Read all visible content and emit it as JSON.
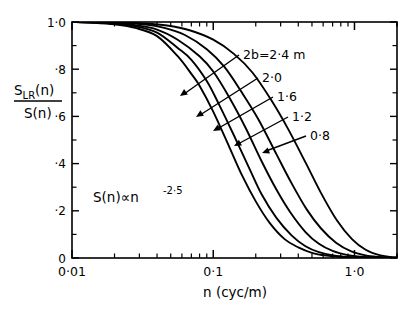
{
  "figure": {
    "name": "lateral-coherence-transfer-function",
    "background": "#ffffff",
    "ink": "#000000"
  },
  "axes": {
    "y": {
      "label_numerator": "S",
      "label_numerator_sub": "LR",
      "label_numerator_arg": "(n)",
      "label_denominator": "S(n)",
      "ticks": [
        "1·0",
        "·8",
        "·6",
        "·4",
        "·2",
        "0"
      ],
      "tick_values": [
        1.0,
        0.8,
        0.6,
        0.4,
        0.2,
        0.0
      ],
      "minor_ticks_per_major": 1,
      "range": [
        0,
        1
      ]
    },
    "x": {
      "label": "n (cyc/m)",
      "ticks": [
        "0·01",
        "0·1",
        "1·0"
      ],
      "tick_values": [
        0.01,
        0.1,
        1.0
      ],
      "scale": "log",
      "range": [
        0.01,
        2.0
      ]
    }
  },
  "annotations": {
    "spectrum_law": "S(n)∝n",
    "spectrum_exponent": "-2·5",
    "series_prefix": "2b=",
    "series_unit": " m"
  },
  "chart_data": {
    "type": "line",
    "title": "",
    "subtitle": "",
    "xlabel": "n (cyc/m)",
    "ylabel": "S_LR(n)/S(n)",
    "xscale": "log",
    "yscale": "linear",
    "xlim": [
      0.01,
      2.0
    ],
    "ylim": [
      0.0,
      1.0
    ],
    "grid": false,
    "legend_position": "inline-leader-labels",
    "xticks": [
      0.01,
      0.1,
      1.0
    ],
    "xticklabels": [
      "0·01",
      "0·1",
      "1·0"
    ],
    "yticks": [
      0.0,
      0.2,
      0.4,
      0.6,
      0.8,
      1.0
    ],
    "yticklabels": [
      "0",
      "·2",
      "·4",
      "·6",
      "·8",
      "1·0"
    ],
    "annotation_text": "S(n) ∝ n^(-2·5)",
    "series": [
      {
        "name": "2b=2·4 m",
        "label": "2b=2·4 m",
        "separation_2b_m": 2.4,
        "x": [
          0.01,
          0.014,
          0.02,
          0.028,
          0.04,
          0.056,
          0.07,
          0.08,
          0.1,
          0.13,
          0.16,
          0.2,
          0.25,
          0.32,
          0.4,
          0.5,
          0.63,
          0.8,
          1.0,
          1.3,
          1.6,
          2.0
        ],
        "y": [
          1.0,
          0.997,
          0.99,
          0.975,
          0.94,
          0.855,
          0.78,
          0.73,
          0.62,
          0.47,
          0.35,
          0.24,
          0.15,
          0.08,
          0.045,
          0.022,
          0.01,
          0.004,
          0.0015,
          0.0005,
          0.0002,
          0.0
        ]
      },
      {
        "name": "2·0",
        "label": "2·0",
        "separation_2b_m": 2.0,
        "x": [
          0.01,
          0.014,
          0.02,
          0.028,
          0.04,
          0.056,
          0.07,
          0.09,
          0.11,
          0.14,
          0.18,
          0.22,
          0.28,
          0.36,
          0.45,
          0.56,
          0.71,
          0.9,
          1.12,
          1.4,
          1.8,
          2.0
        ],
        "y": [
          1.0,
          0.998,
          0.993,
          0.982,
          0.955,
          0.89,
          0.84,
          0.75,
          0.65,
          0.52,
          0.38,
          0.27,
          0.17,
          0.095,
          0.05,
          0.025,
          0.011,
          0.004,
          0.0015,
          0.0005,
          0.0001,
          0.0
        ]
      },
      {
        "name": "1·6",
        "label": "1·6",
        "separation_2b_m": 1.6,
        "x": [
          0.01,
          0.014,
          0.02,
          0.028,
          0.04,
          0.056,
          0.08,
          0.1,
          0.13,
          0.17,
          0.22,
          0.28,
          0.35,
          0.45,
          0.56,
          0.7,
          0.9,
          1.12,
          1.4,
          1.8,
          2.0
        ],
        "y": [
          1.0,
          0.999,
          0.995,
          0.987,
          0.968,
          0.925,
          0.855,
          0.79,
          0.68,
          0.55,
          0.41,
          0.29,
          0.195,
          0.11,
          0.06,
          0.03,
          0.012,
          0.005,
          0.002,
          0.0004,
          0.0
        ]
      },
      {
        "name": "1·2",
        "label": "1·2",
        "separation_2b_m": 1.2,
        "x": [
          0.01,
          0.015,
          0.022,
          0.032,
          0.045,
          0.063,
          0.09,
          0.12,
          0.16,
          0.21,
          0.28,
          0.36,
          0.46,
          0.58,
          0.74,
          0.95,
          1.2,
          1.5,
          1.8,
          2.0
        ],
        "y": [
          1.0,
          0.999,
          0.996,
          0.99,
          0.975,
          0.945,
          0.885,
          0.81,
          0.7,
          0.585,
          0.44,
          0.315,
          0.205,
          0.125,
          0.065,
          0.028,
          0.011,
          0.004,
          0.0012,
          0.0006
        ]
      },
      {
        "name": "0·8",
        "label": "0·8",
        "separation_2b_m": 0.8,
        "x": [
          0.01,
          0.015,
          0.022,
          0.032,
          0.047,
          0.068,
          0.1,
          0.14,
          0.19,
          0.26,
          0.34,
          0.45,
          0.58,
          0.75,
          0.96,
          1.2,
          1.5,
          1.8,
          2.0
        ],
        "y": [
          1.0,
          1.0,
          0.998,
          0.994,
          0.985,
          0.965,
          0.925,
          0.865,
          0.785,
          0.665,
          0.545,
          0.405,
          0.275,
          0.16,
          0.08,
          0.035,
          0.012,
          0.005,
          0.003
        ]
      }
    ]
  }
}
